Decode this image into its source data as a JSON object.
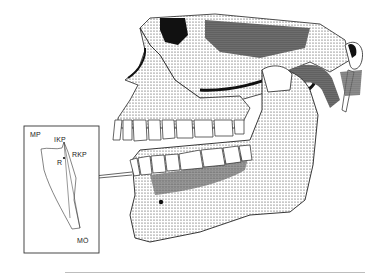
{
  "figure": {
    "inset": {
      "labels": {
        "mp": "MP",
        "ikp": "IKP",
        "rkp": "RKP",
        "r": "R",
        "mo": "MÖ"
      }
    }
  },
  "colors": {
    "ink": "#1a1a1a",
    "paper": "#ffffff",
    "rule": "#bdbdbd"
  }
}
